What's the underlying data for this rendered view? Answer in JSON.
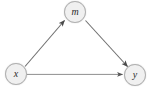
{
  "diagram": {
    "type": "path-diagram",
    "name": "mediation-model",
    "background_color": "#ffffff",
    "nodes": [
      {
        "id": "m",
        "label": "m",
        "cx": 75,
        "cy": 12,
        "r": 11,
        "fill": "#f0f0f0",
        "stroke": "#b0b0b0"
      },
      {
        "id": "x",
        "label": "x",
        "cx": 16,
        "cy": 74,
        "r": 11,
        "fill": "#f0f0f0",
        "stroke": "#b0b0b0"
      },
      {
        "id": "y",
        "label": "y",
        "cx": 135,
        "cy": 75,
        "r": 11,
        "fill": "#f0f0f0",
        "stroke": "#b0b0b0"
      }
    ],
    "edges": [
      {
        "id": "x-to-m",
        "from": "x",
        "to": "m",
        "label": "",
        "arrow": "single",
        "color": "#6b6b6b"
      },
      {
        "id": "m-to-y",
        "from": "m",
        "to": "y",
        "label": "",
        "arrow": "single",
        "color": "#6b6b6b"
      },
      {
        "id": "x-to-y",
        "from": "x",
        "to": "y",
        "label": "",
        "arrow": "single",
        "color": "#8a8a8a"
      }
    ]
  }
}
